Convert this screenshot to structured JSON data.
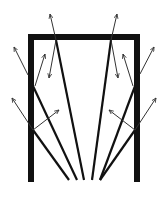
{
  "diagram": {
    "colors": {
      "frame": "#111111",
      "ray": "#111111",
      "arrow": "#333333",
      "background": "#ffffff"
    },
    "frame": {
      "left_x": 31,
      "right_x": 137,
      "top_y": 37,
      "bottom_y": 182
    },
    "rays": [
      {
        "id": "ray-1",
        "from": [
          69,
          180
        ],
        "to": [
          33,
          130
        ]
      },
      {
        "id": "ray-2",
        "from": [
          77,
          180
        ],
        "to": [
          33,
          86
        ]
      },
      {
        "id": "ray-3",
        "from": [
          84,
          180
        ],
        "to": [
          56,
          40
        ]
      },
      {
        "id": "ray-4",
        "from": [
          92,
          180
        ],
        "to": [
          111,
          40
        ]
      },
      {
        "id": "ray-5",
        "from": [
          100,
          180
        ],
        "to": [
          135,
          86
        ]
      },
      {
        "id": "ray-6",
        "from": [
          100,
          180
        ],
        "to": [
          135,
          130
        ]
      }
    ],
    "arrows": [
      {
        "id": "arrow-l1-out",
        "from": [
          33,
          130
        ],
        "to": [
          12,
          98
        ]
      },
      {
        "id": "arrow-l1-in",
        "from": [
          33,
          130
        ],
        "to": [
          59,
          110
        ]
      },
      {
        "id": "arrow-l2-out",
        "from": [
          28,
          75
        ],
        "to": [
          14,
          47
        ]
      },
      {
        "id": "arrow-l2-in",
        "from": [
          35,
          86
        ],
        "to": [
          45,
          54
        ]
      },
      {
        "id": "arrow-t1-out",
        "from": [
          56,
          40
        ],
        "to": [
          50,
          14
        ]
      },
      {
        "id": "arrow-t1-in",
        "from": [
          56,
          40
        ],
        "to": [
          49,
          78
        ]
      },
      {
        "id": "arrow-t2-out",
        "from": [
          111,
          40
        ],
        "to": [
          117,
          14
        ]
      },
      {
        "id": "arrow-t2-in",
        "from": [
          111,
          40
        ],
        "to": [
          118,
          78
        ]
      },
      {
        "id": "arrow-r1-out",
        "from": [
          140,
          74
        ],
        "to": [
          154,
          47
        ]
      },
      {
        "id": "arrow-r1-in",
        "from": [
          133,
          86
        ],
        "to": [
          123,
          54
        ]
      },
      {
        "id": "arrow-r2-out",
        "from": [
          135,
          130
        ],
        "to": [
          156,
          98
        ]
      },
      {
        "id": "arrow-r2-in",
        "from": [
          135,
          130
        ],
        "to": [
          109,
          110
        ]
      }
    ]
  }
}
